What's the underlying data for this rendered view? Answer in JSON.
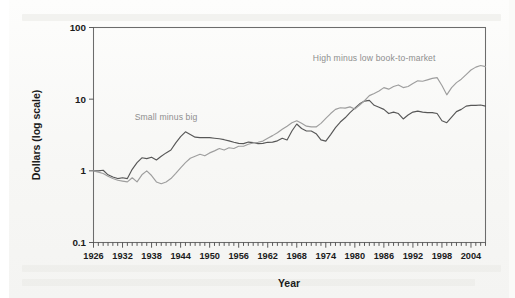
{
  "figure": {
    "background_color": "#f7f7f5",
    "frame_color": "#6c6c6c"
  },
  "chart_data": {
    "type": "line",
    "title": "",
    "subtitle": "",
    "xlabel": "Year",
    "ylabel": "Dollars (log scale)",
    "yscale": "log",
    "ylim": [
      0.1,
      100
    ],
    "ytick_labels": [
      "0.1",
      "1",
      "10",
      "100"
    ],
    "ytick_values": [
      0.1,
      1,
      10,
      100
    ],
    "xlim": [
      1926,
      2007
    ],
    "xtick_labels": [
      "1926",
      "1932",
      "1938",
      "1944",
      "1950",
      "1956",
      "1962",
      "1968",
      "1974",
      "1980",
      "1986",
      "1992",
      "1998",
      "2004"
    ],
    "xtick_values": [
      1926,
      1932,
      1938,
      1944,
      1950,
      1956,
      1962,
      1968,
      1974,
      1980,
      1986,
      1992,
      1998,
      2004
    ],
    "minor_xticks": "every 1 year",
    "grid": false,
    "legend_position": "inline annotations",
    "annotations": [
      {
        "text": "Small minus big",
        "color": "#8e8e8e",
        "x_year": 1941,
        "y_value": 5.2
      },
      {
        "text": "High minus low book-to-market",
        "color": "#8e8e8e",
        "x_year": 1984,
        "y_value": 34
      }
    ],
    "series": [
      {
        "name": "Small minus big",
        "color": "#575757",
        "x": [
          1926,
          1927,
          1928,
          1929,
          1930,
          1931,
          1932,
          1933,
          1934,
          1935,
          1936,
          1937,
          1938,
          1939,
          1940,
          1941,
          1942,
          1943,
          1944,
          1945,
          1946,
          1947,
          1948,
          1949,
          1950,
          1951,
          1952,
          1953,
          1954,
          1955,
          1956,
          1957,
          1958,
          1959,
          1960,
          1961,
          1962,
          1963,
          1964,
          1965,
          1966,
          1967,
          1968,
          1969,
          1970,
          1971,
          1972,
          1973,
          1974,
          1975,
          1976,
          1977,
          1978,
          1979,
          1980,
          1981,
          1982,
          1983,
          1984,
          1985,
          1986,
          1987,
          1988,
          1989,
          1990,
          1991,
          1992,
          1993,
          1994,
          1995,
          1996,
          1997,
          1998,
          1999,
          2000,
          2001,
          2002,
          2003,
          2004,
          2005,
          2006,
          2007
        ],
        "y": [
          1.0,
          1.0,
          1.02,
          0.88,
          0.82,
          0.78,
          0.8,
          0.78,
          1.05,
          1.3,
          1.52,
          1.48,
          1.55,
          1.42,
          1.6,
          1.78,
          1.95,
          2.45,
          3.0,
          3.5,
          3.22,
          2.95,
          2.9,
          2.92,
          2.9,
          2.85,
          2.8,
          2.72,
          2.62,
          2.5,
          2.42,
          2.4,
          2.52,
          2.48,
          2.4,
          2.42,
          2.5,
          2.52,
          2.62,
          2.85,
          2.7,
          3.6,
          4.5,
          3.9,
          3.6,
          3.6,
          3.3,
          2.7,
          2.6,
          3.2,
          4.0,
          4.8,
          5.5,
          6.5,
          7.5,
          8.6,
          9.4,
          9.6,
          8.2,
          7.7,
          7.2,
          6.3,
          6.6,
          6.3,
          5.3,
          6.0,
          6.6,
          6.8,
          6.6,
          6.5,
          6.5,
          6.3,
          5.0,
          4.7,
          5.6,
          6.7,
          7.2,
          8.0,
          8.2,
          8.2,
          8.3,
          8.0
        ]
      },
      {
        "name": "High minus low book-to-market",
        "color": "#9e9e9e",
        "x": [
          1926,
          1927,
          1928,
          1929,
          1930,
          1931,
          1932,
          1933,
          1934,
          1935,
          1936,
          1937,
          1938,
          1939,
          1940,
          1941,
          1942,
          1943,
          1944,
          1945,
          1946,
          1947,
          1948,
          1949,
          1950,
          1951,
          1952,
          1953,
          1954,
          1955,
          1956,
          1957,
          1958,
          1959,
          1960,
          1961,
          1962,
          1963,
          1964,
          1965,
          1966,
          1967,
          1968,
          1969,
          1970,
          1971,
          1972,
          1973,
          1974,
          1975,
          1976,
          1977,
          1978,
          1979,
          1980,
          1981,
          1982,
          1983,
          1984,
          1985,
          1986,
          1987,
          1988,
          1989,
          1990,
          1991,
          1992,
          1993,
          1994,
          1995,
          1996,
          1997,
          1998,
          1999,
          2000,
          2001,
          2002,
          2003,
          2004,
          2005,
          2006,
          2007
        ],
        "y": [
          1.0,
          0.96,
          0.92,
          0.84,
          0.78,
          0.74,
          0.72,
          0.7,
          0.8,
          0.7,
          0.88,
          1.0,
          0.86,
          0.7,
          0.66,
          0.7,
          0.78,
          0.92,
          1.1,
          1.3,
          1.5,
          1.6,
          1.7,
          1.62,
          1.78,
          1.9,
          2.05,
          1.95,
          2.1,
          2.05,
          2.2,
          2.2,
          2.35,
          2.45,
          2.5,
          2.6,
          2.85,
          3.1,
          3.4,
          3.8,
          4.2,
          4.7,
          5.0,
          4.6,
          4.2,
          4.1,
          4.1,
          4.6,
          5.4,
          6.3,
          7.2,
          7.6,
          7.5,
          7.8,
          7.3,
          8.3,
          9.5,
          11.2,
          12.0,
          13.0,
          14.5,
          13.8,
          15.0,
          15.8,
          14.5,
          15.0,
          16.5,
          18.0,
          17.8,
          18.6,
          19.5,
          20.0,
          15.5,
          11.5,
          14.5,
          17.0,
          19.0,
          22.0,
          25.5,
          28.0,
          29.5,
          28.5
        ]
      }
    ]
  }
}
